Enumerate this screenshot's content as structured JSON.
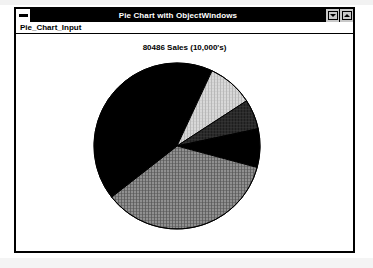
{
  "window": {
    "title": "Pie Chart with ObjectWindows",
    "sysmenu_icon": "system-menu-icon",
    "minimize_label": "",
    "maximize_label": "",
    "minimize_icon": "minimize-icon",
    "maximize_icon": "maximize-icon"
  },
  "menubar": {
    "items": [
      {
        "label": "Pie_Chart_Input"
      }
    ]
  },
  "chart_data": {
    "type": "pie",
    "title": "80486 Sales (10,000's)",
    "xlabel": "",
    "ylabel": "",
    "grid": false,
    "legend": "none",
    "start_angle_deg": 0,
    "direction": "clockwise",
    "center": {
      "cx": 86,
      "cy": 85
    },
    "radius": 83,
    "labels": [
      "Slice 1",
      "Slice 2",
      "Slice 3",
      "Slice 4",
      "Slice 5",
      "Slice 6"
    ],
    "values": [
      7,
      9,
      6,
      7,
      35,
      36
    ],
    "angles_deg": [
      25,
      32,
      21,
      27,
      127,
      128
    ],
    "fills": [
      "solid-black",
      "light-gray-hatch",
      "dark-crosshatch",
      "solid-black",
      "medium-gray-hatch",
      "solid-black"
    ],
    "colors": [
      "#000000",
      "#c0c0c0",
      "#303030",
      "#000000",
      "#787878",
      "#000000"
    ]
  },
  "theme": {
    "titlebar_bg": "#000000",
    "titlebar_fg": "#ffffff",
    "window_bg": "#ffffff",
    "border": "#000000",
    "button_face": "#c8c8c8"
  }
}
